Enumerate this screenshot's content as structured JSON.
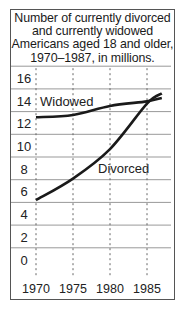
{
  "chart": {
    "title_lines": [
      "Number of currently divorced",
      "and currently widowed",
      "Americans aged 18 and older,",
      "1970–1987, in millions."
    ]
  },
  "chart_data": {
    "type": "line",
    "title": "Number of currently divorced and currently widowed Americans aged 18 and older, 1970–1987, in millions.",
    "xlabel": "",
    "ylabel": "",
    "x": [
      1970,
      1975,
      1980,
      1985,
      1987
    ],
    "x_tick_labels": [
      "1970",
      "1975",
      "1980",
      "1985"
    ],
    "y_tick_labels": [
      "16",
      "14",
      "12",
      "10",
      "8",
      "6",
      "4",
      "2",
      "0"
    ],
    "ylim": [
      0,
      18
    ],
    "grid": {
      "horizontal": "solid",
      "vertical": "dashed"
    },
    "legend": "inline labels",
    "series": [
      {
        "name": "Widowed",
        "values": [
          13.5,
          13.7,
          14.5,
          14.9,
          15.2
        ],
        "color": "#1a1a1a"
      },
      {
        "name": "Divorced",
        "values": [
          6.2,
          8.1,
          10.7,
          14.7,
          15.6
        ],
        "color": "#1a1a1a"
      }
    ]
  },
  "colors": {
    "line": "#1a1a1a",
    "grid": "#999999",
    "border": "#555555",
    "background": "#ffffff"
  }
}
